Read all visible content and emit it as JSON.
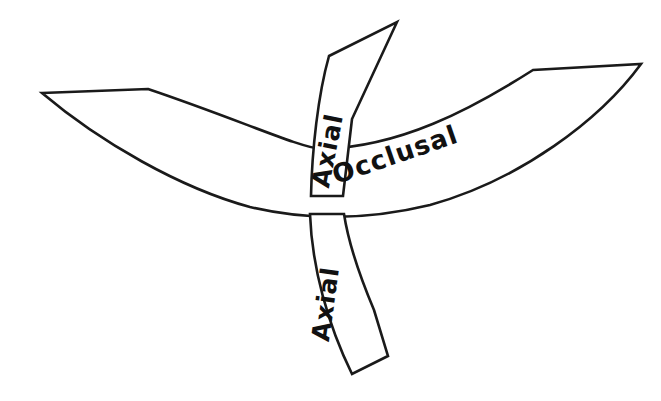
{
  "figure": {
    "background_color": "#ffffff",
    "line_color": "#1a1a1a",
    "fill_color": "#ffffff",
    "title": "",
    "labels": {
      "occlusal": "Occlusal",
      "axial_upper": "Axial",
      "axial_lower": "Axial"
    },
    "label_placements": {
      "occlusal": {
        "x": 398,
        "y": 163,
        "rotation": -19
      },
      "axial_upper": {
        "x": 336,
        "y": 152,
        "rotation": -79
      },
      "axial_lower": {
        "x": 334,
        "y": 305,
        "rotation": -82
      }
    },
    "shapes": {
      "occlusal_band": {
        "name": "occlusal-band",
        "path": "M 42 93 L 148 89 C 240 120 300 148 322 149 C 400 147 470 110 533 70 L 641 64 C 600 120 520 180 430 205 C 360 222 300 219 250 207 C 180 188 100 142 42 93 Z"
      },
      "axial_band_upper": {
        "name": "axial-band-upper",
        "path": "M 397 22 L 352 119 L 343 196 L 311 196 C 312 150 318 95 329 56 Z"
      },
      "axial_band_lower": {
        "name": "axial-band-lower",
        "path": "M 310 214 C 312 268 328 325 352 374 L 388 356 L 374 310 C 358 272 348 240 344 214 Z"
      }
    }
  }
}
